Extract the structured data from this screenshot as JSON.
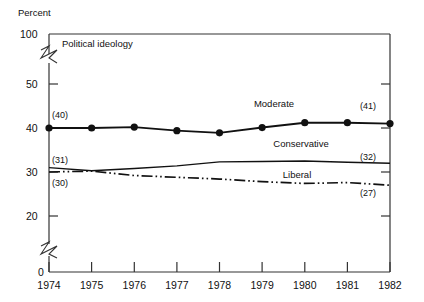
{
  "chart_data": {
    "type": "line",
    "title": "Political ideology",
    "ylabel": "Percent",
    "xlabel": "",
    "grid": false,
    "legend_position": "inline-annotations",
    "axis_break": true,
    "x": [
      1974,
      1975,
      1976,
      1977,
      1978,
      1979,
      1980,
      1981,
      1982
    ],
    "categories": [
      "1974",
      "1975",
      "1976",
      "1977",
      "1978",
      "1979",
      "1980",
      "1981",
      "1982"
    ],
    "ylim": [
      0,
      100
    ],
    "y_ticks": [
      0,
      20,
      30,
      40,
      50,
      100
    ],
    "y_tick_labels": [
      "0",
      "20",
      "30",
      "40",
      "50",
      "100"
    ],
    "series": [
      {
        "name": "Moderate",
        "style": "solid-with-markers",
        "values": [
          40,
          40,
          40.2,
          39.4,
          38.9,
          40.1,
          41.2,
          41.2,
          41
        ],
        "start_label": "(40)",
        "end_label": "(41)"
      },
      {
        "name": "Conservative",
        "style": "solid",
        "values": [
          31,
          30.3,
          30.8,
          31.4,
          32.3,
          32.4,
          32.5,
          32.2,
          32
        ],
        "start_label": "(31)",
        "end_label": "(32)"
      },
      {
        "name": "Liberal",
        "style": "dash-dot-dot",
        "values": [
          30,
          30.2,
          29.2,
          28.8,
          28.4,
          27.8,
          27.4,
          27.6,
          27
        ],
        "start_label": "(30)",
        "end_label": "(27)"
      }
    ]
  },
  "annotations": {
    "moderate_label": "Moderate",
    "conservative_label": "Conservative",
    "liberal_label": "Liberal",
    "moderate_start": "(40)",
    "moderate_end": "(41)",
    "conservative_start": "(31)",
    "conservative_end": "(32)",
    "liberal_start": "(30)",
    "liberal_end": "(27)"
  },
  "colors": {
    "line": "#111111",
    "axis": "#333333",
    "background": "#ffffff",
    "text": "#111111"
  }
}
